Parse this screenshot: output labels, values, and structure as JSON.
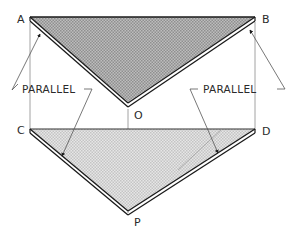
{
  "figure": {
    "type": "orthographic projection diagram",
    "points": {
      "A": {
        "label": "A",
        "x": 30,
        "y": 17
      },
      "B": {
        "label": "B",
        "x": 255,
        "y": 17
      },
      "O": {
        "label": "O",
        "x": 128,
        "y": 107
      },
      "C": {
        "label": "C",
        "x": 30,
        "y": 129
      },
      "D": {
        "label": "D",
        "x": 255,
        "y": 129
      },
      "P": {
        "label": "P",
        "x": 128,
        "y": 215
      }
    },
    "annotations": {
      "left": "PARALLEL",
      "right": "PARALLEL"
    },
    "colors": {
      "line": "#1a1a1a",
      "upper_fill": "#a9a9a9",
      "lower_fill": "#d2d2d2",
      "projector": "#8a8a8a",
      "leader": "#555555"
    }
  }
}
